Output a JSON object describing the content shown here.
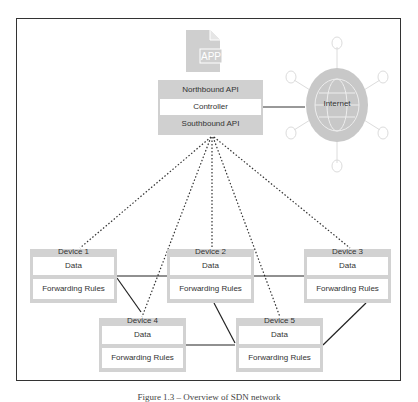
{
  "app_icon": {
    "label": "APP"
  },
  "controller": {
    "northbound": "Northbound API",
    "controller": "Controller",
    "southbound": "Southbound API"
  },
  "internet": {
    "label": "Internet"
  },
  "devices": [
    {
      "title": "Device 1",
      "data": "Data",
      "rules": "Forwarding Rules"
    },
    {
      "title": "Device 2",
      "data": "Data",
      "rules": "Forwarding Rules"
    },
    {
      "title": "Device 3",
      "data": "Data",
      "rules": "Forwarding Rules"
    },
    {
      "title": "Device 4",
      "data": "Data",
      "rules": "Forwarding Rules"
    },
    {
      "title": "Device 5",
      "data": "Data",
      "rules": "Forwarding Rules"
    }
  ],
  "caption": "Figure 1.3 – Overview of SDN network",
  "colors": {
    "box_gray": "#d2d2d2",
    "line": "#333333",
    "internet_gray": "#c8c8c8"
  }
}
